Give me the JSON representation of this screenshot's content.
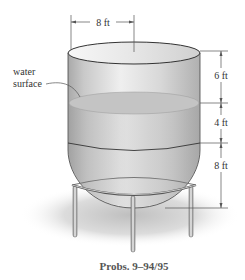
{
  "figure": {
    "caption": "Probs. 9–94/95",
    "labels": {
      "water_surface_line1": "water",
      "water_surface_line2": "surface"
    },
    "dimensions": {
      "diameter": "8 ft",
      "top_to_water": "6 ft",
      "water_to_seam": "4 ft",
      "seam_to_bottom": "8 ft"
    },
    "colors": {
      "tank_body": "#cfcfcf",
      "tank_highlight": "#f2f2f2",
      "water": "#bdbdbd",
      "shadow": "#d9d9d9",
      "outline": "#444444"
    }
  }
}
